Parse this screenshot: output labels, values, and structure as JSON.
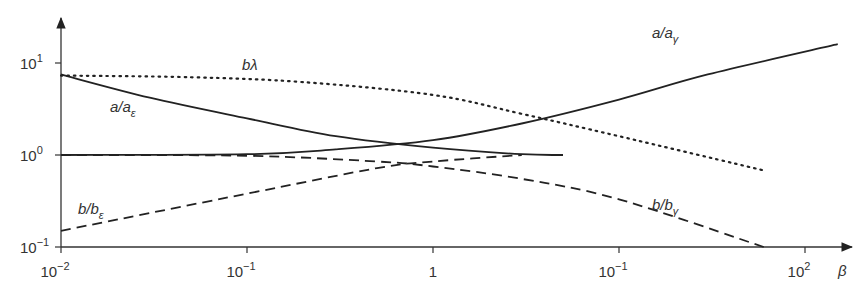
{
  "chart_data": {
    "type": "line",
    "title": "",
    "xlabel": "β",
    "ylabel": "",
    "xscale": "log",
    "yscale": "log",
    "xlim": [
      0.01,
      200
    ],
    "ylim": [
      0.1,
      30
    ],
    "grid": false,
    "legend": "inline labels",
    "x_ticks": [
      {
        "base": "10",
        "exp": "−2"
      },
      {
        "base": "10",
        "exp": "−1"
      },
      {
        "base": "1",
        "exp": ""
      },
      {
        "base": "10",
        "exp": "−1"
      },
      {
        "base": "10",
        "exp": "2"
      }
    ],
    "y_ticks": [
      {
        "base": "10",
        "exp": "1"
      },
      {
        "base": "10",
        "exp": "0"
      },
      {
        "base": "10",
        "exp": "−1"
      }
    ],
    "series": [
      {
        "name": "a/aε",
        "label_main": "a/a",
        "label_sub": "ε",
        "style": "solid",
        "x": [
          0.01,
          0.03,
          0.1,
          0.3,
          1,
          3,
          5
        ],
        "y": [
          7.5,
          4.2,
          2.5,
          1.6,
          1.2,
          1.02,
          1.0
        ]
      },
      {
        "name": "a/aγ",
        "label_main": "a/a",
        "label_sub": "γ",
        "style": "solid",
        "x": [
          0.01,
          0.1,
          0.3,
          1,
          3,
          10,
          30,
          150
        ],
        "y": [
          1.0,
          1.02,
          1.15,
          1.45,
          2.2,
          4.0,
          7.5,
          16
        ]
      },
      {
        "name": "bλ",
        "label_main": "bλ",
        "label_sub": "",
        "style": "dotted",
        "x": [
          0.01,
          0.05,
          0.2,
          1,
          3,
          10,
          60
        ],
        "y": [
          7.3,
          7.0,
          6.2,
          4.5,
          2.8,
          1.6,
          0.68
        ]
      },
      {
        "name": "b/bε",
        "label_main": "b/b",
        "label_sub": "ε",
        "style": "dashed",
        "x": [
          0.01,
          0.1,
          0.5,
          1,
          3
        ],
        "y": [
          0.15,
          0.38,
          0.72,
          0.85,
          1.0
        ]
      },
      {
        "name": "b/bγ",
        "label_main": "b/b",
        "label_sub": "γ",
        "style": "dashed",
        "x": [
          0.01,
          0.1,
          0.5,
          1,
          3,
          10,
          60
        ],
        "y": [
          1.0,
          0.98,
          0.85,
          0.75,
          0.55,
          0.33,
          0.1
        ]
      }
    ]
  }
}
